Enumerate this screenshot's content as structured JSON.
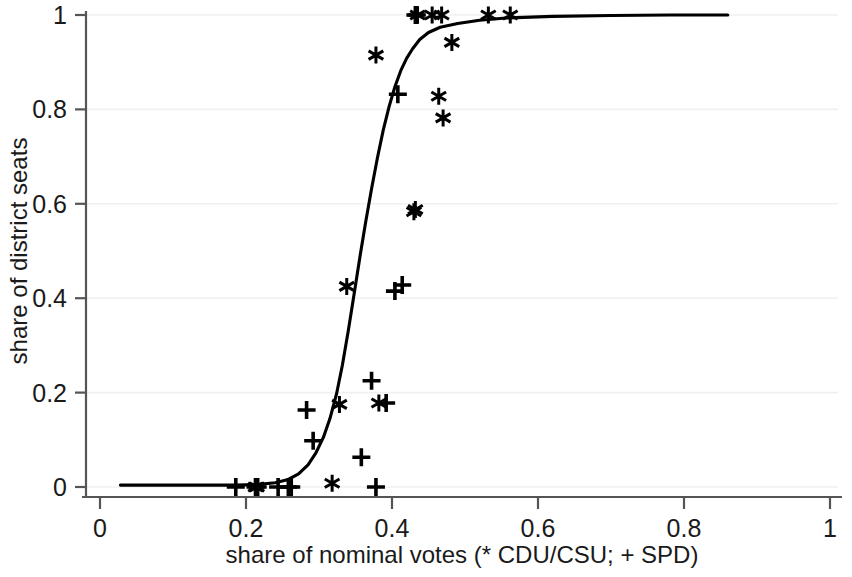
{
  "chart_data": {
    "type": "scatter",
    "title": "",
    "xlabel": "share of nominal votes (* CDU/CSU; + SPD)",
    "ylabel": "share of district seats",
    "xlim": [
      0,
      1
    ],
    "ylim": [
      0,
      1
    ],
    "xticks": [
      0,
      0.2,
      0.4,
      0.6,
      0.8,
      1
    ],
    "xticklabels": [
      "0",
      "0.2",
      "0.4",
      "0.6",
      "0.8",
      "1"
    ],
    "yticks": [
      0,
      0.2,
      0.4,
      0.6,
      0.8,
      1
    ],
    "yticklabels": [
      "0",
      "0.2",
      "0.4",
      "0.6",
      "0.8",
      "1"
    ],
    "grid": true,
    "grid_axis": "y",
    "legend": "in-axis-label",
    "marker_color": "#000000",
    "line_color": "#000000",
    "grid_color": "#f0f0f0",
    "axis_color": "#555555",
    "series": [
      {
        "name": "CDU/CSU",
        "marker": "*",
        "points": [
          [
            0.213,
            0.0
          ],
          [
            0.215,
            0.0
          ],
          [
            0.318,
            0.008
          ],
          [
            0.328,
            0.175
          ],
          [
            0.338,
            0.425
          ],
          [
            0.378,
            0.915
          ],
          [
            0.382,
            0.178
          ],
          [
            0.43,
            0.583
          ],
          [
            0.432,
            0.588
          ],
          [
            0.435,
            1.0
          ],
          [
            0.455,
            1.0
          ],
          [
            0.464,
            0.828
          ],
          [
            0.468,
            1.0
          ],
          [
            0.47,
            0.782
          ],
          [
            0.482,
            0.942
          ],
          [
            0.532,
            1.0
          ],
          [
            0.562,
            1.0
          ]
        ]
      },
      {
        "name": "SPD",
        "marker": "+",
        "points": [
          [
            0.186,
            0.0
          ],
          [
            0.213,
            0.0
          ],
          [
            0.216,
            0.0
          ],
          [
            0.244,
            0.0
          ],
          [
            0.258,
            0.0
          ],
          [
            0.262,
            0.0
          ],
          [
            0.283,
            0.163
          ],
          [
            0.292,
            0.098
          ],
          [
            0.358,
            0.063
          ],
          [
            0.372,
            0.225
          ],
          [
            0.378,
            0.0
          ],
          [
            0.392,
            0.178
          ],
          [
            0.404,
            0.415
          ],
          [
            0.414,
            0.428
          ],
          [
            0.408,
            0.832
          ],
          [
            0.432,
            1.0
          ],
          [
            0.434,
            1.0
          ]
        ]
      }
    ],
    "fit_line": {
      "name": "logistic fit",
      "points": [
        [
          0.028,
          0.004
        ],
        [
          0.06,
          0.004
        ],
        [
          0.1,
          0.004
        ],
        [
          0.15,
          0.004
        ],
        [
          0.185,
          0.004
        ],
        [
          0.215,
          0.005
        ],
        [
          0.24,
          0.009
        ],
        [
          0.258,
          0.016
        ],
        [
          0.272,
          0.028
        ],
        [
          0.285,
          0.047
        ],
        [
          0.296,
          0.073
        ],
        [
          0.306,
          0.105
        ],
        [
          0.315,
          0.145
        ],
        [
          0.324,
          0.197
        ],
        [
          0.332,
          0.258
        ],
        [
          0.34,
          0.33
        ],
        [
          0.348,
          0.408
        ],
        [
          0.356,
          0.487
        ],
        [
          0.364,
          0.562
        ],
        [
          0.372,
          0.632
        ],
        [
          0.38,
          0.697
        ],
        [
          0.388,
          0.756
        ],
        [
          0.396,
          0.806
        ],
        [
          0.404,
          0.848
        ],
        [
          0.412,
          0.882
        ],
        [
          0.42,
          0.908
        ],
        [
          0.428,
          0.928
        ],
        [
          0.438,
          0.948
        ],
        [
          0.45,
          0.963
        ],
        [
          0.466,
          0.974
        ],
        [
          0.49,
          0.982
        ],
        [
          0.52,
          0.989
        ],
        [
          0.56,
          0.994
        ],
        [
          0.62,
          0.997
        ],
        [
          0.7,
          0.999
        ],
        [
          0.78,
          1.0
        ],
        [
          0.86,
          1.0
        ]
      ]
    }
  },
  "geometry": {
    "plot_left": 86,
    "plot_right": 838,
    "plot_top": 15,
    "plot_bottom": 487,
    "x_zero_px": 100,
    "x_one_px": 830,
    "y_zero_px": 487,
    "y_one_px": 15
  }
}
